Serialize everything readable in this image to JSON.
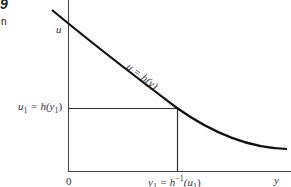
{
  "fragments": {
    "top": "9",
    "bottom": "n"
  },
  "labels": {
    "u_axis": "u",
    "curve": "u = h(y)",
    "u1": "u",
    "u1_sub": "1",
    "u1_rest": " = h(y",
    "u1_sub2": "1",
    "u1_close": ")",
    "origin": "0",
    "y1": "y",
    "y1_sub": "1",
    "y1_rest": " = h",
    "y1_sup": "−1",
    "y1_paren": "(u",
    "y1_sub2": "1",
    "y1_close": ")",
    "y_axis": "y"
  },
  "colors": {
    "curve": "#111111",
    "axes": "#444444"
  }
}
